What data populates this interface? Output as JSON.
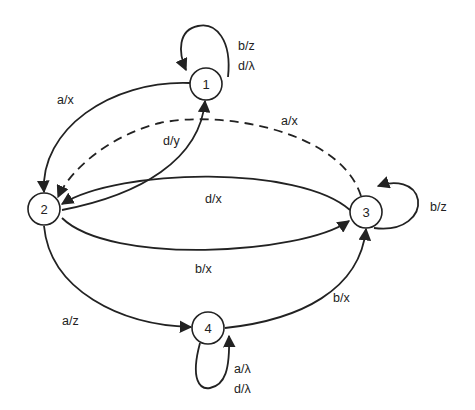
{
  "diagram": {
    "type": "finite-state-machine",
    "states": [
      {
        "id": "1",
        "label": "1"
      },
      {
        "id": "2",
        "label": "2"
      },
      {
        "id": "3",
        "label": "3"
      },
      {
        "id": "4",
        "label": "4"
      }
    ],
    "transitions": [
      {
        "from": "1",
        "to": "1",
        "labels": [
          "b/z",
          "d/λ"
        ],
        "style": "solid"
      },
      {
        "from": "1",
        "to": "2",
        "labels": [
          "a/x"
        ],
        "style": "solid"
      },
      {
        "from": "2",
        "to": "1",
        "labels": [
          "d/y"
        ],
        "style": "solid"
      },
      {
        "from": "3",
        "to": "2",
        "labels": [
          "a/x"
        ],
        "style": "dashed"
      },
      {
        "from": "3",
        "to": "2",
        "labels": [
          "d/x"
        ],
        "style": "solid"
      },
      {
        "from": "2",
        "to": "3",
        "labels": [
          "b/x"
        ],
        "style": "solid"
      },
      {
        "from": "3",
        "to": "3",
        "labels": [
          "b/z"
        ],
        "style": "solid"
      },
      {
        "from": "2",
        "to": "4",
        "labels": [
          "a/z"
        ],
        "style": "solid"
      },
      {
        "from": "4",
        "to": "3",
        "labels": [
          "b/x"
        ],
        "style": "solid"
      },
      {
        "from": "4",
        "to": "4",
        "labels": [
          "a/λ",
          "d/λ"
        ],
        "style": "solid"
      }
    ],
    "text": {
      "s1": "1",
      "s2": "2",
      "s3": "3",
      "s4": "4",
      "loop1_a": "b/z",
      "loop1_b": "d/λ",
      "e12": "a/x",
      "e21": "d/y",
      "e32_dashed": "a/x",
      "e32": "d/x",
      "e23": "b/x",
      "loop3": "b/z",
      "e24": "a/z",
      "e43": "b/x",
      "loop4_a": "a/λ",
      "loop4_b": "d/λ"
    }
  }
}
